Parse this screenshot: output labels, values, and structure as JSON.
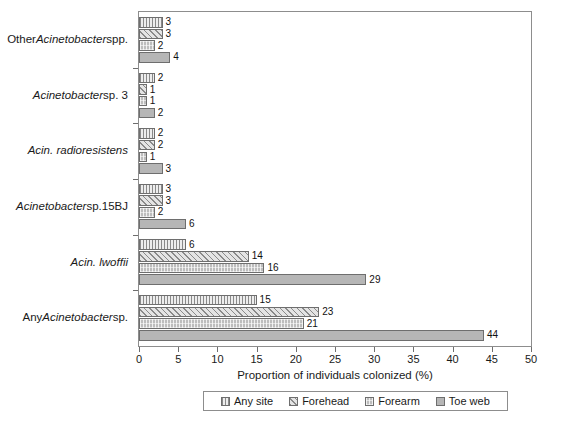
{
  "chart_data": {
    "type": "bar",
    "orientation": "horizontal",
    "title": "",
    "xlabel": "Proportion of individuals colonized (%)",
    "ylabel": "",
    "xlim": [
      0,
      50
    ],
    "xticks": [
      0,
      5,
      10,
      15,
      20,
      25,
      30,
      35,
      40,
      45,
      50
    ],
    "grid": false,
    "legend_position": "bottom",
    "categories": [
      "Other Acinetobacter spp.",
      "Acinetobacter sp. 3",
      "Acin. radioresistens",
      "Acinetobacter sp.15BJ",
      "Acin. lwoffii",
      "Any Acinetobacter sp."
    ],
    "category_labels_html": [
      "Other <i>Acinetobacter</i> spp.",
      "<i>Acinetobacter</i> sp. 3",
      "<i>Acin. radioresistens</i>",
      "<i>Acinetobacter</i> sp.15BJ",
      "<i>Acin. lwoffii</i>",
      "Any <i>Acinetobacter</i> sp."
    ],
    "series": [
      {
        "name": "Any site",
        "pattern": "vertical-lines",
        "color": "#ededed",
        "values": [
          3,
          2,
          2,
          3,
          6,
          15
        ]
      },
      {
        "name": "Forehead",
        "pattern": "diagonal-hatch",
        "color": "#e4e4e4",
        "values": [
          3,
          1,
          2,
          3,
          14,
          23
        ]
      },
      {
        "name": "Forearm",
        "pattern": "dotted-grid",
        "color": "#bdbdbd",
        "values": [
          2,
          1,
          1,
          2,
          16,
          21
        ]
      },
      {
        "name": "Toe web",
        "pattern": "solid",
        "color": "#b6b6b6",
        "values": [
          4,
          2,
          3,
          6,
          29,
          44
        ]
      }
    ]
  },
  "legend": {
    "items": [
      {
        "label": "Any site"
      },
      {
        "label": "Forehead"
      },
      {
        "label": "Forearm"
      },
      {
        "label": "Toe web"
      }
    ]
  }
}
